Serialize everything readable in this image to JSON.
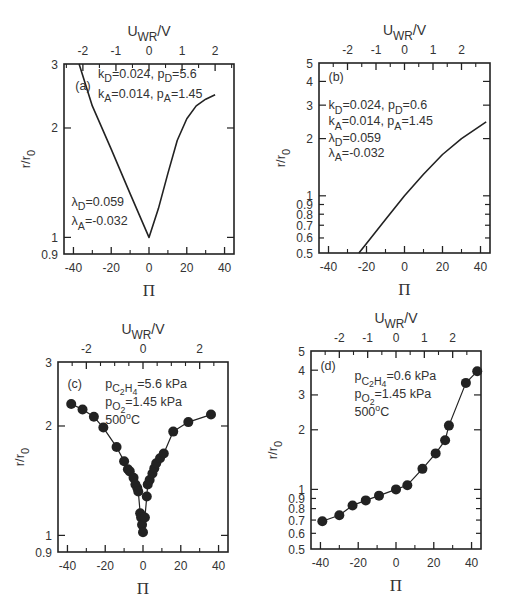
{
  "figure": {
    "colors": {
      "ink": "#222222",
      "text": "#333333",
      "background": "#ffffff"
    }
  },
  "chart_data": [
    {
      "panel": "(a)",
      "type": "line",
      "frame": {
        "left": 64,
        "top": 64,
        "right": 234,
        "bottom": 254
      },
      "xlabel": "Π",
      "ylabel": "r/r0",
      "top_xlabel": "UWR/V",
      "xlim": [
        -45,
        45
      ],
      "ylim": [
        0.9,
        3
      ],
      "yscale": "log",
      "xticks": [
        -40,
        -20,
        0,
        20,
        40
      ],
      "xminor": [
        -30,
        -10,
        10,
        30
      ],
      "yticks": [
        0.9,
        1,
        2,
        3
      ],
      "yticklabels": [
        "0.9",
        "1",
        "2",
        "3"
      ],
      "top_ticks": [
        -2,
        -1,
        0,
        1,
        2
      ],
      "top_scale": {
        "pi_per_volt": 17.5
      },
      "annotations": [
        {
          "text": "(a)",
          "x": -39,
          "y": 2.55
        },
        {
          "text": "kD=0.024, pD=5.6",
          "x": -27,
          "y": 2.75
        },
        {
          "text": "kA=0.014, pA=1.45",
          "x": -27,
          "y": 2.42
        },
        {
          "text": "λD=0.059",
          "x": -41,
          "y": 1.22
        },
        {
          "text": "λA=-0.032",
          "x": -41,
          "y": 1.08
        }
      ],
      "series": [
        {
          "name": "model",
          "marker": "none",
          "x": [
            -37,
            -30,
            -20,
            -10,
            0,
            5,
            10,
            15,
            20,
            25,
            30,
            35
          ],
          "y": [
            3.0,
            2.3,
            1.75,
            1.32,
            1.0,
            1.2,
            1.5,
            1.85,
            2.12,
            2.3,
            2.4,
            2.47
          ]
        }
      ]
    },
    {
      "panel": "(b)",
      "type": "line",
      "frame": {
        "left": 319,
        "top": 63,
        "right": 490,
        "bottom": 253
      },
      "xlabel": "Π",
      "ylabel": "r/r0",
      "top_xlabel": "UWR/V",
      "xlim": [
        -45,
        45
      ],
      "ylim": [
        0.5,
        5
      ],
      "yscale": "log",
      "xticks": [
        -40,
        -20,
        0,
        20,
        40
      ],
      "xminor": [
        -30,
        -10,
        10,
        30
      ],
      "yticks": [
        0.5,
        0.6,
        0.7,
        0.8,
        0.9,
        1,
        2,
        3,
        4,
        5
      ],
      "yticklabels": [
        "0.5",
        "0.6",
        "0.7",
        "0.8",
        "0.9",
        "1",
        "2",
        "3",
        "4",
        "5"
      ],
      "top_ticks": [
        -2,
        -1,
        0,
        1,
        2
      ],
      "top_scale": {
        "pi_per_volt": 15
      },
      "annotations": [
        {
          "text": "(b)",
          "x": -40,
          "y": 4.0
        },
        {
          "text": "kD=0.024, pD=0.6",
          "x": -40,
          "y": 2.85
        },
        {
          "text": "kA=0.014, pA=1.45",
          "x": -40,
          "y": 2.35
        },
        {
          "text": "λD=0.059",
          "x": -40,
          "y": 1.92
        },
        {
          "text": "λA=-0.032",
          "x": -40,
          "y": 1.6
        }
      ],
      "series": [
        {
          "name": "model",
          "marker": "none",
          "x": [
            -24,
            -20,
            -10,
            0,
            10,
            20,
            30,
            43
          ],
          "y": [
            0.5,
            0.56,
            0.75,
            1.0,
            1.3,
            1.65,
            2.0,
            2.45
          ]
        }
      ]
    },
    {
      "panel": "(c)",
      "type": "line",
      "frame": {
        "left": 58,
        "top": 362,
        "right": 228,
        "bottom": 552
      },
      "xlabel": "Π",
      "ylabel": "r/r0",
      "top_xlabel": "UWR/V",
      "xlim": [
        -45,
        45
      ],
      "ylim": [
        0.9,
        3
      ],
      "yscale": "log",
      "xticks": [
        -40,
        -20,
        0,
        20,
        40
      ],
      "xminor": [
        -30,
        -10,
        10,
        30
      ],
      "yticks": [
        0.9,
        1,
        2,
        3
      ],
      "yticklabels": [
        "0.9",
        "1",
        "2",
        "3"
      ],
      "top_ticks": [
        -2,
        0,
        2
      ],
      "top_ticks_minor": [
        -1,
        1
      ],
      "top_scale": {
        "pi_per_volt": 15
      },
      "annotations": [
        {
          "text": "(c)",
          "x": -40,
          "y": 2.55
        },
        {
          "text": "pC2H4=5.6 kPa",
          "x": -20,
          "y": 2.55
        },
        {
          "text": "pO2=1.45 kPa",
          "x": -20,
          "y": 2.27
        },
        {
          "text": "500oC",
          "x": -20,
          "y": 2.03
        }
      ],
      "series": [
        {
          "name": "experimental",
          "marker": "circle",
          "x": [
            -38,
            -32,
            -26,
            -21,
            -14,
            -10,
            -8,
            -7,
            -5,
            -4,
            -3,
            -2.5,
            -1.5,
            -1,
            -0.5,
            0,
            1,
            2,
            2.5,
            3.5,
            5,
            6,
            7,
            9,
            11,
            16,
            24,
            36
          ],
          "y": [
            2.3,
            2.22,
            2.12,
            1.98,
            1.75,
            1.6,
            1.52,
            1.5,
            1.44,
            1.38,
            1.35,
            1.32,
            1.15,
            1.12,
            1.07,
            1.02,
            1.12,
            1.28,
            1.38,
            1.42,
            1.48,
            1.53,
            1.58,
            1.63,
            1.68,
            1.93,
            2.05,
            2.15
          ]
        }
      ]
    },
    {
      "panel": "(d)",
      "type": "line",
      "frame": {
        "left": 311,
        "top": 351,
        "right": 481,
        "bottom": 549
      },
      "xlabel": "Π",
      "ylabel": "r/r0",
      "top_xlabel": "UWR/V",
      "xlim": [
        -45,
        45
      ],
      "ylim": [
        0.5,
        5
      ],
      "yscale": "log",
      "xticks": [
        -40,
        -20,
        0,
        20,
        40
      ],
      "xminor": [
        -30,
        -10,
        10,
        30
      ],
      "yticks": [
        0.5,
        0.6,
        0.7,
        0.8,
        0.9,
        1,
        2,
        3,
        4,
        5
      ],
      "yticklabels": [
        "0.5",
        "0.6",
        "0.7",
        "0.8",
        "0.9",
        "1",
        "2",
        "3",
        "4",
        "5"
      ],
      "top_ticks": [
        -2,
        -1,
        0,
        1,
        2
      ],
      "top_scale": {
        "pi_per_volt": 15
      },
      "annotations": [
        {
          "text": "(d)",
          "x": -40,
          "y": 4.0
        },
        {
          "text": "pC2H4=0.6 kPa",
          "x": -22,
          "y": 3.55
        },
        {
          "text": "pO2=1.45 kPa",
          "x": -22,
          "y": 2.9
        },
        {
          "text": "500oC",
          "x": -22,
          "y": 2.35
        }
      ],
      "series": [
        {
          "name": "experimental",
          "marker": "circle",
          "x": [
            -39,
            -30,
            -23,
            -16,
            -9,
            0,
            6,
            14,
            21,
            26,
            28,
            37,
            43
          ],
          "y": [
            0.69,
            0.74,
            0.83,
            0.88,
            0.93,
            1.0,
            1.05,
            1.27,
            1.52,
            1.77,
            2.1,
            3.45,
            3.95
          ]
        }
      ]
    }
  ]
}
